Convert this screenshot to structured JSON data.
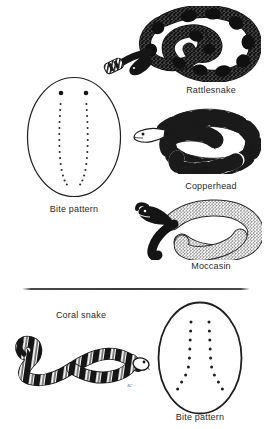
{
  "figure": {
    "width": 266,
    "height": 429,
    "background_color": "#ffffff",
    "ink_color": "#1a1a1a",
    "label_color": "#2b2b2b"
  },
  "sections": [
    {
      "id": "pit-vipers",
      "snakes": [
        {
          "id": "rattlesnake",
          "label": "Rattlesnake",
          "label_x": 166,
          "label_y": 85,
          "description": "coiled dark-blotched snake with rattle on tail"
        },
        {
          "id": "copperhead",
          "label": "Copperhead",
          "label_x": 166,
          "label_y": 181,
          "description": "coiled snake with dark hourglass crossbands and pale saddles"
        },
        {
          "id": "moccasin",
          "label": "Moccasin",
          "label_x": 166,
          "label_y": 261,
          "description": "coiled snake with dark head and stippled speckled body"
        }
      ],
      "bite_pattern": {
        "id": "bite-pattern-pit-viper",
        "label": "Bite pattern",
        "label_x": 41,
        "label_y": 204,
        "ellipse": {
          "cx": 73.5,
          "cy": 137,
          "rx": 46,
          "ry": 59
        },
        "fang_marks": 2,
        "tooth_rows": 2,
        "teeth_per_row": 15,
        "description": "two large fang punctures above two long columns of fine tooth marks"
      }
    },
    {
      "id": "coral-snake",
      "snakes": [
        {
          "id": "coral-snake",
          "label": "Coral snake",
          "label_x": 41,
          "label_y": 310,
          "description": "slender banded snake with black, pale and ringed crossbands"
        }
      ],
      "bite_pattern": {
        "id": "bite-pattern-coral-snake",
        "label": "Bite pattern",
        "label_x": 162,
        "label_y": 412,
        "ellipse": {
          "cx": 199,
          "cy": 357,
          "rx": 41,
          "ry": 55
        },
        "fang_marks": 2,
        "tooth_rows": 2,
        "teeth_per_row": 9,
        "description": "two columns of evenly spaced tooth marks splaying outward at the lower end"
      }
    }
  ],
  "divider": {
    "id": "section-divider",
    "x": 22,
    "y": 288,
    "width": 228
  }
}
